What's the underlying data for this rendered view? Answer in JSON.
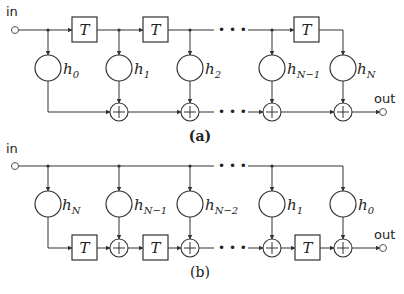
{
  "diagram_a": {
    "caption": "(a)",
    "input_label": "in",
    "output_label": "out",
    "delay_label": "T",
    "coefficients": [
      {
        "base": "h",
        "sub": "0"
      },
      {
        "base": "h",
        "sub": "1"
      },
      {
        "base": "h",
        "sub": "2"
      },
      {
        "base": "h",
        "sub": "N−1"
      },
      {
        "base": "h",
        "sub": "N"
      }
    ],
    "ellipsis": "• • •"
  },
  "diagram_b": {
    "caption": "(b)",
    "input_label": "in",
    "output_label": "out",
    "delay_label": "T",
    "coefficients": [
      {
        "base": "h",
        "sub": "N"
      },
      {
        "base": "h",
        "sub": "N−1"
      },
      {
        "base": "h",
        "sub": "N−2"
      },
      {
        "base": "h",
        "sub": "1"
      },
      {
        "base": "h",
        "sub": "0"
      }
    ],
    "ellipsis": "• • •"
  }
}
